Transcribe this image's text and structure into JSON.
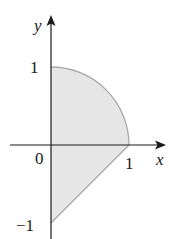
{
  "diagram": {
    "type": "region-plot",
    "axes": {
      "x_label": "x",
      "y_label": "y",
      "origin_label": "0"
    },
    "ticks": {
      "x_one": "1",
      "y_one": "1",
      "y_neg_one": "−1"
    },
    "region": {
      "fill": "#e6e6e6",
      "stroke": "#a8a8a8",
      "boundaries": [
        "quarter circle from (0,1) to (1,0)",
        "line from (1,0) to (0,-1)",
        "y-axis from (0,-1) to (0,1)"
      ]
    },
    "colors": {
      "axis": "#1a1a1a",
      "text": "#1a1a1a"
    }
  }
}
